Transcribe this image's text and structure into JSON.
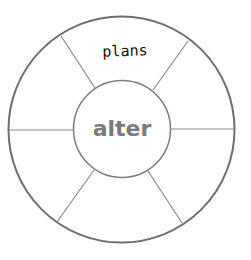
{
  "diagram": {
    "type": "word-wheel",
    "center_word": "alter",
    "segments": [
      {
        "position": "top",
        "label": "plans"
      },
      {
        "position": "top-right",
        "label": ""
      },
      {
        "position": "bottom-right",
        "label": ""
      },
      {
        "position": "bottom",
        "label": ""
      },
      {
        "position": "bottom-left",
        "label": ""
      },
      {
        "position": "top-left",
        "label": ""
      }
    ],
    "colors": {
      "outer_stroke": "#6e6e6e",
      "inner_stroke": "#7a7a7a",
      "divider_stroke": "#8a8a8a",
      "center_text": "#7a7a7a",
      "segment_text": "#111111"
    }
  }
}
